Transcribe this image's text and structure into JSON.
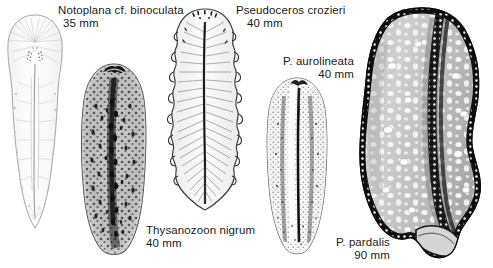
{
  "plate": {
    "title": "Polyclad flatworm species plate",
    "background": "#ffffff",
    "ink": "#1a1a1a",
    "width": 493,
    "height": 268
  },
  "specimens": [
    {
      "id": "notoplana-binoculata",
      "genus_species": "Notoplana cf. binoculata",
      "size": "35 mm",
      "description": "pale elongate flatworm with fine radiating lines and paired eyespot clusters",
      "tone": "very-pale"
    },
    {
      "id": "thysanozoon-nigrum",
      "genus_species": "Thysanozoon nigrum",
      "size": "40 mm",
      "description": "dark oval flatworm densely covered with papillae and dark pseudotentacles",
      "tone": "dark-mottled"
    },
    {
      "id": "pseudoceros-crozieri",
      "genus_species": "Pseudoceros crozieri",
      "size": "40 mm",
      "description": "oval flatworm with strongly ruffled undulating margins and radiating striations",
      "tone": "light-ruffled"
    },
    {
      "id": "pseudoceros-aurolineata",
      "genus_species": "P. aurolineata",
      "size": "40 mm",
      "description": "speckled elongate flatworm with dark median line",
      "tone": "speckled"
    },
    {
      "id": "pseudoceros-pardalis",
      "genus_species": "P. pardalis",
      "size": "90 mm",
      "description": "large flatworm with pale ocellated spots and dark beaded ruffled margin",
      "tone": "spotted-large"
    }
  ],
  "labels": [
    {
      "name": "label-notoplana",
      "species": "Notoplana cf. binoculata",
      "size": "35 mm"
    },
    {
      "name": "label-crozieri",
      "species": "Pseudoceros crozieri",
      "size": "40 mm"
    },
    {
      "name": "label-aurolineata",
      "species": "P. aurolineata",
      "size": "40 mm"
    },
    {
      "name": "label-thysanozoon",
      "species": "Thysanozoon nigrum",
      "size": "40 mm"
    },
    {
      "name": "label-pardalis",
      "species": "P. pardalis",
      "size": "90 mm"
    }
  ]
}
